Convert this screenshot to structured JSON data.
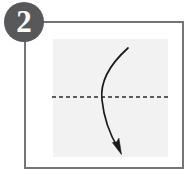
{
  "figure": {
    "width": 194,
    "height": 179,
    "background_color": "#ffffff"
  },
  "step_badge": {
    "number": "2",
    "shape": "circle",
    "fill_color": "#58585a",
    "text_color": "#ffffff",
    "diameter": 40,
    "x": 4,
    "y": 2
  },
  "frame": {
    "name": "instruction panel border",
    "stroke_color": "#74747a",
    "stroke_width": 2,
    "x": 24,
    "y": 21,
    "width": 160,
    "height": 148
  },
  "paper": {
    "name": "paper sheet",
    "shape": "square",
    "fill_color": "#f2f2f3",
    "x": 53,
    "y": 39,
    "width": 115,
    "height": 118
  },
  "fold_line": {
    "name": "horizontal valley fold guide",
    "style": "dashed",
    "stroke_color": "#2b2b2b",
    "stroke_width": 1.4,
    "dash_pattern": "4 3",
    "x1": 52,
    "y1": 97,
    "x2": 169,
    "y2": 97
  },
  "fold_arrow": {
    "name": "fold direction arrow",
    "stroke_color": "#1a1a1a",
    "stroke_width": 1.6,
    "direction": "top to bottom, bowing left",
    "start_x": 128,
    "start_y": 48,
    "end_x": 119,
    "end_y": 150,
    "path": "M128,48 C108,66 100,84 102,100 C104,120 112,138 119,150",
    "arrowhead_fill": "#1a1a1a"
  }
}
